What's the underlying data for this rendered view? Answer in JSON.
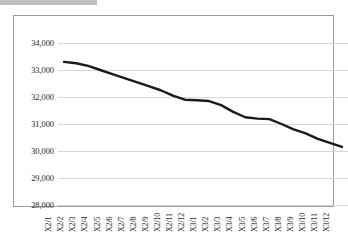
{
  "chart_data": {
    "type": "line",
    "title": "",
    "subtitle": "",
    "xlabel": "",
    "ylabel": "",
    "grid": true,
    "legend": false,
    "legend_position": "none",
    "ylim": [
      28000,
      34000
    ],
    "ytick_step": 1000,
    "ytick_labels": [
      "34,000",
      "33,000",
      "32,000",
      "31,000",
      "30,000",
      "29,000",
      "28,000"
    ],
    "ytick_values": [
      34000,
      33000,
      32000,
      31000,
      30000,
      29000,
      28000
    ],
    "line_color": "#1a1a1a",
    "grid_color": "#d6d6d6",
    "frame_color": "#9a9a9a",
    "categories": [
      "X2/1",
      "X2/2",
      "X2/3",
      "X2/4",
      "X2/5",
      "X2/6",
      "X2/7",
      "X2/8",
      "X2/9",
      "X2/10",
      "X2/11",
      "X2/12",
      "X3/1",
      "X3/2",
      "X3/3",
      "X3/4",
      "X3/5",
      "X3/6",
      "X3/7",
      "X3/8",
      "X3/9",
      "X3/10",
      "X3/11",
      "X3/12"
    ],
    "values": [
      33300,
      33250,
      33150,
      33000,
      32850,
      32700,
      32550,
      32400,
      32250,
      32050,
      31900,
      31880,
      31850,
      31700,
      31450,
      31250,
      31200,
      31180,
      31000,
      30800,
      30650,
      30450,
      30300,
      30150
    ]
  }
}
